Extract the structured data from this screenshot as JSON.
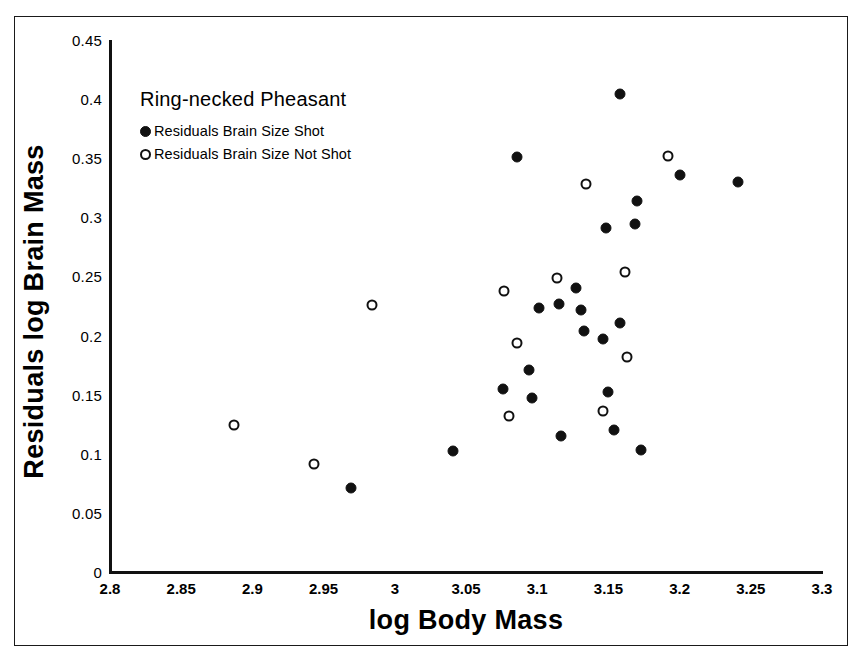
{
  "chart_data": {
    "type": "scatter",
    "title": "Ring-necked Pheasant",
    "xlabel": "log Body Mass",
    "ylabel": "Residuals log Brain Mass",
    "xlim": [
      2.8,
      3.3
    ],
    "ylim": [
      0,
      0.45
    ],
    "xticks": [
      "2.8",
      "2.85",
      "2.9",
      "2.95",
      "3",
      "3.05",
      "3.1",
      "3.15",
      "3.2",
      "3.25",
      "3.3"
    ],
    "yticks": [
      "0",
      "0.05",
      "0.1",
      "0.15",
      "0.2",
      "0.25",
      "0.3",
      "0.35",
      "0.4",
      "0.45"
    ],
    "grid": false,
    "legend_position": "upper-left-inside",
    "marker_color": "#111111",
    "series": [
      {
        "name": "Residuals Brain Size Shot",
        "marker": "filled-circle",
        "points": [
          [
            2.969,
            0.071
          ],
          [
            3.041,
            0.102
          ],
          [
            3.076,
            0.155
          ],
          [
            3.086,
            0.351
          ],
          [
            3.094,
            0.171
          ],
          [
            3.096,
            0.147
          ],
          [
            3.101,
            0.223
          ],
          [
            3.115,
            0.227
          ],
          [
            3.117,
            0.115
          ],
          [
            3.127,
            0.24
          ],
          [
            3.131,
            0.222
          ],
          [
            3.133,
            0.204
          ],
          [
            3.146,
            0.197
          ],
          [
            3.148,
            0.291
          ],
          [
            3.15,
            0.152
          ],
          [
            3.154,
            0.12
          ],
          [
            3.158,
            0.404
          ],
          [
            3.158,
            0.211
          ],
          [
            3.169,
            0.294
          ],
          [
            3.17,
            0.314
          ],
          [
            3.173,
            0.103
          ],
          [
            3.2,
            0.336
          ],
          [
            3.241,
            0.33
          ]
        ]
      },
      {
        "name": "Residuals Brain Size Not Shot",
        "marker": "open-circle",
        "points": [
          [
            2.887,
            0.124
          ],
          [
            2.943,
            0.091
          ],
          [
            2.984,
            0.226
          ],
          [
            3.077,
            0.238
          ],
          [
            3.08,
            0.132
          ],
          [
            3.086,
            0.194
          ],
          [
            3.114,
            0.249
          ],
          [
            3.134,
            0.328
          ],
          [
            3.146,
            0.136
          ],
          [
            3.162,
            0.254
          ],
          [
            3.163,
            0.182
          ],
          [
            3.192,
            0.352
          ]
        ]
      }
    ]
  }
}
